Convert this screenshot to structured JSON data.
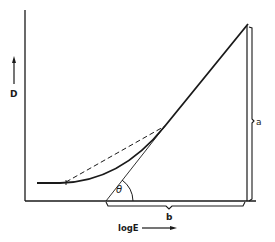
{
  "diagram": {
    "type": "characteristic-curve",
    "y_axis_label": "D",
    "x_axis_label": "logE",
    "angle_label": "θ",
    "vertical_extent_label": "a",
    "horizontal_extent_label": "b",
    "colors": {
      "ink": "#1a1a1a",
      "background": "#ffffff"
    }
  }
}
